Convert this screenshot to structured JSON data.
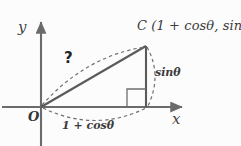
{
  "figure": {
    "kind": "geometry-diagram",
    "background_color": "#fcfcfc",
    "stroke_color": "#5a5a5a",
    "axis_color": "#6b6b6b",
    "text_color": "#3b3b3b",
    "axes": {
      "y_label": "y",
      "x_label": "x",
      "origin_label": "O",
      "origin_px": {
        "x": 41,
        "y": 107
      }
    },
    "points": {
      "c": {
        "name": "C",
        "label": "C (1 + cosθ, sinθ)",
        "px": {
          "x": 146,
          "y": 46
        }
      },
      "foot": {
        "name": "foot-of-perpendicular",
        "px": {
          "x": 146,
          "y": 107
        }
      }
    },
    "segments": {
      "hypotenuse_label": "?",
      "vertical_leg_label": "sinθ",
      "base_leg_label": "1 + cosθ"
    },
    "markers": {
      "right_angle": "right-angle-square"
    }
  }
}
